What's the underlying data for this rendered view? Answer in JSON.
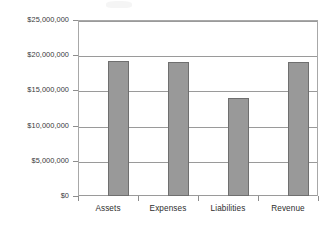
{
  "chart_data": {
    "type": "bar",
    "title": "",
    "subtitle": "",
    "xlabel": "",
    "ylabel": "",
    "categories": [
      "Assets",
      "Expenses",
      "Liabilities",
      "Revenue"
    ],
    "values": [
      19200000,
      19000000,
      13900000,
      19000000
    ],
    "series": [
      {
        "name": "Amount",
        "values": [
          19200000,
          19000000,
          13900000,
          19000000
        ]
      }
    ],
    "ylim": [
      0,
      25000000
    ],
    "ytick_values": [
      0,
      5000000,
      10000000,
      15000000,
      20000000,
      25000000
    ],
    "ytick_labels": [
      "$0",
      "$5,000,000",
      "$10,000,000",
      "$15,000,000",
      "$20,000,000",
      "$25,000,000"
    ],
    "grid": true,
    "grid_axis": "y",
    "legend": false,
    "legend_position": "none",
    "bar_color": "#999999",
    "bar_border_color": "#6f6f6f",
    "gridline_color": "#9a9a9a",
    "frame_color": "#a8a8a8",
    "text_color": "#2e2e2e",
    "background_color": "#ffffff",
    "annotations": []
  }
}
